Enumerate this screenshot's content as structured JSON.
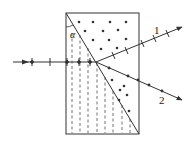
{
  "diagram": {
    "type": "birefringent-prism",
    "angle_label": "α",
    "ray_labels": [
      "1",
      "2"
    ],
    "colors": {
      "line": "#333333",
      "background": "#ffffff"
    },
    "prism": {
      "x": 66,
      "y": 13,
      "w": 73,
      "h": 121
    },
    "incident_ray": {
      "from": [
        13,
        62
      ],
      "to": [
        96,
        62
      ]
    },
    "ray1": {
      "from": [
        96,
        62
      ],
      "to": [
        182,
        27
      ],
      "polarization": "perpendicular-ticks"
    },
    "ray2": {
      "from": [
        96,
        62
      ],
      "to": [
        182,
        100
      ],
      "polarization": "dots"
    }
  }
}
